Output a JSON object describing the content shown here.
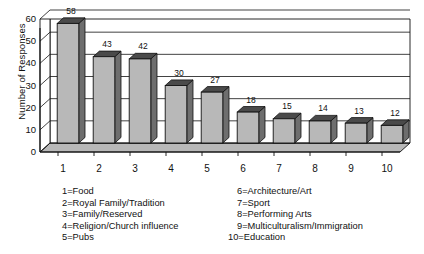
{
  "chart_data": {
    "type": "bar",
    "title": "",
    "xlabel": "",
    "ylabel": "Number of Responses",
    "categories": [
      "1",
      "2",
      "3",
      "4",
      "5",
      "6",
      "7",
      "8",
      "9",
      "10"
    ],
    "values": [
      58,
      43,
      42,
      30,
      27,
      18,
      15,
      14,
      13,
      12
    ],
    "data_labels": [
      "58",
      "43",
      "42",
      "30",
      "27",
      "18",
      "15",
      "14",
      "13",
      "12"
    ],
    "ylim": [
      0,
      60
    ],
    "yticks": [
      "60",
      "50",
      "40",
      "30",
      "20",
      "10",
      "0"
    ],
    "ytick_values": [
      60,
      50,
      40,
      30,
      20,
      10,
      0
    ],
    "grid": "horizontal",
    "legend_position": "below",
    "style": "3d-columns-grayscale",
    "colors": {
      "bar_front": "#b8b8b8",
      "bar_top": "#4a4a4a",
      "bar_side": "#6e6e6e",
      "floor": "#b8b8b8",
      "outline": "#111111",
      "gridline": "#111111",
      "background": "#ffffff"
    },
    "series": [
      {
        "name": "Responses",
        "values": [
          58,
          43,
          42,
          30,
          27,
          18,
          15,
          14,
          13,
          12
        ]
      }
    ],
    "category_definitions": [
      {
        "key": "1",
        "label": "1=Food"
      },
      {
        "key": "2",
        "label": "2=Royal Family/Tradition"
      },
      {
        "key": "3",
        "label": "3=Family/Reserved"
      },
      {
        "key": "4",
        "label": "4=Religion/Church influence"
      },
      {
        "key": "5",
        "label": "5=Pubs"
      },
      {
        "key": "6",
        "label": "6=Architecture/Art"
      },
      {
        "key": "7",
        "label": "7=Sport"
      },
      {
        "key": "8",
        "label": "8=Performing Arts"
      },
      {
        "key": "9",
        "label": "9=Multiculturalism/Immigration"
      },
      {
        "key": "10",
        "label": "10=Education"
      }
    ]
  },
  "legend": {
    "left_column": [
      "1=Food",
      "2=Royal Family/Tradition",
      "3=Family/Reserved",
      "4=Religion/Church influence",
      "5=Pubs"
    ],
    "right_column": [
      "6=Architecture/Art",
      "7=Sport",
      "8=Performing Arts",
      "9=Multiculturalism/Immigration",
      "10=Education"
    ]
  }
}
